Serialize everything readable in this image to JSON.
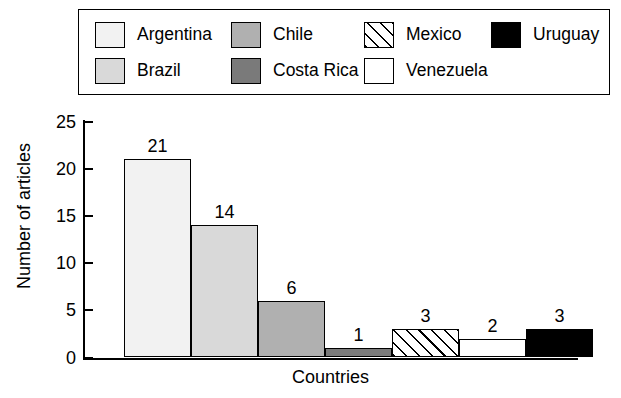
{
  "legend": {
    "items": [
      {
        "label": "Argentina",
        "swatch": "light-gray-swatch",
        "fill_class": "fill-argentina",
        "row": 0,
        "col": 0
      },
      {
        "label": "Chile",
        "swatch": "medium-gray-swatch",
        "fill_class": "fill-chile",
        "row": 0,
        "col": 1
      },
      {
        "label": "Mexico",
        "swatch": "hatched-swatch",
        "fill_class": "fill-mexico",
        "row": 0,
        "col": 2
      },
      {
        "label": "Uruguay",
        "swatch": "black-swatch",
        "fill_class": "fill-uruguay",
        "row": 0,
        "col": 3
      },
      {
        "label": "Brazil",
        "swatch": "pale-gray-swatch",
        "fill_class": "fill-brazil",
        "row": 1,
        "col": 0
      },
      {
        "label": "Costa Rica",
        "swatch": "dark-gray-swatch",
        "fill_class": "fill-costarica",
        "row": 1,
        "col": 1
      },
      {
        "label": "Venezuela",
        "swatch": "white-swatch",
        "fill_class": "fill-venezuela",
        "row": 1,
        "col": 2
      }
    ]
  },
  "chart_data": {
    "type": "bar",
    "title": "",
    "xlabel": "Countries",
    "ylabel": "Number of articles",
    "categories": [
      "Argentina",
      "Brazil",
      "Chile",
      "Costa Rica",
      "Mexico",
      "Venezuela",
      "Uruguay"
    ],
    "values": [
      21,
      14,
      6,
      1,
      3,
      2,
      3
    ],
    "data_labels": [
      "21",
      "14",
      "6",
      "1",
      "3",
      "2",
      "3"
    ],
    "fills": [
      "fill-argentina",
      "fill-brazil",
      "fill-chile",
      "fill-costarica",
      "fill-mexico",
      "fill-venezuela",
      "fill-uruguay"
    ],
    "ylim": [
      0,
      25
    ],
    "yticks": [
      0,
      5,
      10,
      15,
      20,
      25
    ],
    "ytick_labels": [
      "0",
      "5",
      "10",
      "15",
      "20",
      "25"
    ],
    "grid": false,
    "legend_position": "top",
    "bars_adjacent": true,
    "colors": {
      "axis": "#000000",
      "bar_outline": "#000000",
      "background": "#ffffff"
    }
  }
}
